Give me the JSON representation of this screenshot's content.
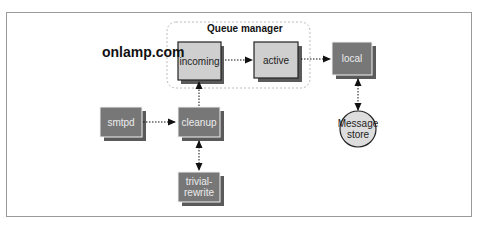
{
  "diagram": {
    "brand": "onlamp.com",
    "group": {
      "label": "Queue manager"
    },
    "nodes": [
      {
        "id": "incoming",
        "label": "incoming",
        "style": "highlight"
      },
      {
        "id": "active",
        "label": "active",
        "style": "highlight"
      },
      {
        "id": "local",
        "label": "local",
        "style": "dark"
      },
      {
        "id": "smtpd",
        "label": "smtpd",
        "style": "dark"
      },
      {
        "id": "cleanup",
        "label": "cleanup",
        "style": "dark"
      },
      {
        "id": "trivial_rewrite",
        "label_line1": "trivial-",
        "label_line2": "rewrite",
        "style": "dark"
      },
      {
        "id": "message_store",
        "label_line1": "Message",
        "label_line2": "store",
        "style": "circle"
      }
    ],
    "edges": [
      {
        "from": "smtpd",
        "to": "cleanup",
        "type": "dotted-arrow"
      },
      {
        "from": "cleanup",
        "to": "incoming",
        "type": "dotted-arrow"
      },
      {
        "from": "cleanup",
        "to": "trivial_rewrite",
        "type": "dotted-bidirectional"
      },
      {
        "from": "incoming",
        "to": "active",
        "type": "dotted-arrow"
      },
      {
        "from": "active",
        "to": "local",
        "type": "dotted-arrow"
      },
      {
        "from": "local",
        "to": "message_store",
        "type": "dotted-bidirectional"
      }
    ],
    "colors": {
      "dark_box": "#777777",
      "dark_shadow": "#5a5a5a",
      "highlight_box": "#cfcfcf",
      "circle_fill": "#dddddd",
      "group_border": "#bbbbbb",
      "frame_border": "#9a9a9a"
    }
  }
}
